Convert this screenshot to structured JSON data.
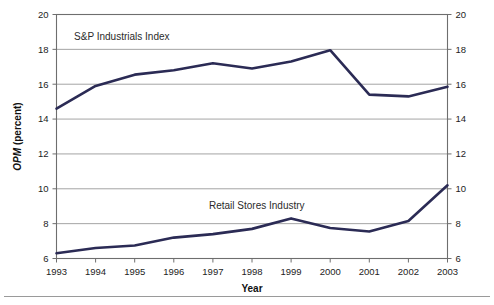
{
  "chart_data": {
    "type": "line",
    "title": "",
    "subtitle": "",
    "xlabel": "Year",
    "ylabel": "OPM (percent)",
    "ylabel_italic_part": "OPM",
    "ylabel_normal_part": " (percent)",
    "categories": [
      "1993",
      "1994",
      "1995",
      "1996",
      "1997",
      "1998",
      "1999",
      "2000",
      "2001",
      "2002",
      "2003"
    ],
    "x": [
      1993,
      1994,
      1995,
      1996,
      1997,
      1998,
      1999,
      2000,
      2001,
      2002,
      2003
    ],
    "xlim": [
      1993,
      2003
    ],
    "ylim": [
      6,
      20
    ],
    "yticks": [
      6,
      8,
      10,
      12,
      14,
      16,
      18,
      20
    ],
    "ytick_labels": [
      "6",
      "8",
      "10",
      "12",
      "14",
      "16",
      "18",
      "20"
    ],
    "right_axis": true,
    "right_ytick_labels": [
      "6",
      "8",
      "10",
      "12",
      "14",
      "16",
      "18",
      "20"
    ],
    "grid": true,
    "grid_axis": "y",
    "legend": "inline-labels",
    "series": [
      {
        "name": "S&P Industrials Index",
        "color": "#2b2b55",
        "label_x": 1993.45,
        "label_y": 18.55,
        "values": [
          14.6,
          15.9,
          16.55,
          16.8,
          17.2,
          16.9,
          17.3,
          17.95,
          15.4,
          15.3,
          15.85
        ]
      },
      {
        "name": "Retail Stores Industry",
        "color": "#2b2b55",
        "label_x": 1996.9,
        "label_y": 8.85,
        "values": [
          6.3,
          6.6,
          6.75,
          7.2,
          7.4,
          7.7,
          8.3,
          7.75,
          7.55,
          8.15,
          10.2
        ]
      }
    ],
    "annotations": [
      {
        "text": "S&P Industrials Index",
        "x": 1993.45,
        "y": 18.55
      },
      {
        "text": "Retail Stores Industry",
        "x": 1996.9,
        "y": 8.85
      }
    ],
    "colors": {
      "line": "#2b2b55",
      "grid": "#8d8d8d",
      "frame": "#6e6e6e",
      "text": "#1d1d1d",
      "background": "#ffffff"
    }
  }
}
